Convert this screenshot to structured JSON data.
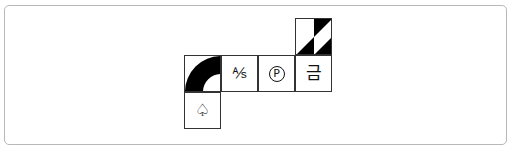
{
  "tiles": [
    {
      "id": "arc",
      "symbol": "",
      "icon": "quarter-arc-icon"
    },
    {
      "id": "as",
      "symbol": "⅍",
      "icon": "a-per-s-symbol"
    },
    {
      "id": "p",
      "symbol": "P",
      "icon": "circled-p-symbol"
    },
    {
      "id": "geum",
      "symbol": "금",
      "icon": "hangul-geum-symbol"
    },
    {
      "id": "diag",
      "symbol": "",
      "icon": "diagonal-triangle-icon"
    },
    {
      "id": "spade",
      "symbol": "♤",
      "icon": "white-spade-symbol"
    }
  ],
  "colors": {
    "border": "#333333",
    "fill": "#000000",
    "frame": "#b8b8b8"
  }
}
